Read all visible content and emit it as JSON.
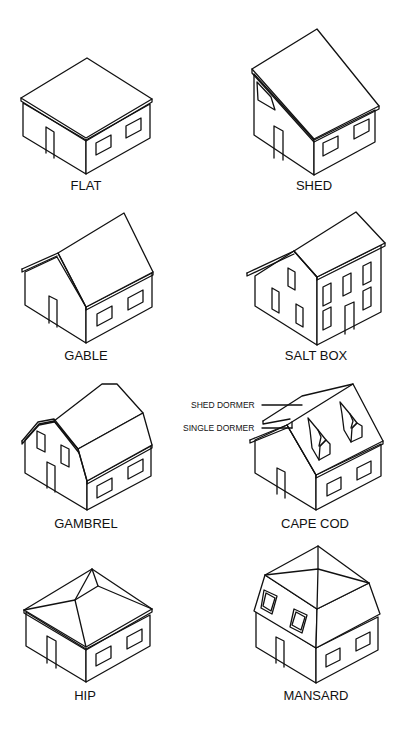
{
  "diagram": {
    "type": "roof-styles-reference",
    "background": "#ffffff",
    "line_color": "#111111",
    "houses": [
      {
        "id": "flat",
        "label": "FLAT"
      },
      {
        "id": "shed",
        "label": "SHED"
      },
      {
        "id": "gable",
        "label": "GABLE"
      },
      {
        "id": "salt-box",
        "label": "SALT BOX"
      },
      {
        "id": "gambrel",
        "label": "GAMBREL"
      },
      {
        "id": "cape-cod",
        "label": "CAPE COD",
        "annotations": [
          "SHED DORMER",
          "SINGLE DORMER"
        ]
      },
      {
        "id": "hip",
        "label": "HIP"
      },
      {
        "id": "mansard",
        "label": "MANSARD"
      }
    ]
  }
}
